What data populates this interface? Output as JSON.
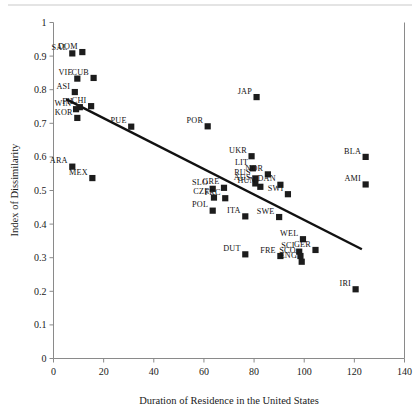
{
  "chart_data": {
    "type": "scatter",
    "title": "",
    "xlabel": "Duration of Residence in the United States",
    "ylabel": "Index of Dissimilarity",
    "xlim": [
      0,
      140
    ],
    "ylim": [
      0,
      1
    ],
    "xticks": [
      0,
      20,
      40,
      60,
      80,
      100,
      120,
      140
    ],
    "yticks": [
      0,
      0.1,
      0.2,
      0.3,
      0.4,
      0.5,
      0.6,
      0.7,
      0.8,
      0.9,
      1
    ],
    "xticklabels": [
      "0",
      "20",
      "40",
      "60",
      "80",
      "100",
      "120",
      "140"
    ],
    "yticklabels": [
      "0",
      "0.1",
      "0.2",
      "0.3",
      "0.4",
      "0.5",
      "0.6",
      "0.7",
      "0.8",
      "0.9",
      "1"
    ],
    "grid": false,
    "legend": null,
    "marker_shape": "square",
    "marker_color": "#1c1c1c",
    "trendline": {
      "type": "linear",
      "x0": 5.0,
      "y0": 0.772,
      "x1": 123.0,
      "y1": 0.325,
      "color": "#111111"
    },
    "points": [
      {
        "label": "SAL",
        "x": 7.5,
        "y": 0.908
      },
      {
        "label": "DOM",
        "x": 11.5,
        "y": 0.912
      },
      {
        "label": "VIE",
        "x": 9.5,
        "y": 0.833
      },
      {
        "label": "CUB",
        "x": 16.0,
        "y": 0.835
      },
      {
        "label": "ASI",
        "x": 8.5,
        "y": 0.793
      },
      {
        "label": "FIL",
        "x": 10.5,
        "y": 0.748
      },
      {
        "label": "CHI",
        "x": 15.0,
        "y": 0.751
      },
      {
        "label": "WIN",
        "x": 9.0,
        "y": 0.742
      },
      {
        "label": "KOR",
        "x": 9.5,
        "y": 0.716
      },
      {
        "label": "PUE",
        "x": 31.0,
        "y": 0.69
      },
      {
        "label": "ARA",
        "x": 7.5,
        "y": 0.571
      },
      {
        "label": "MEX",
        "x": 15.5,
        "y": 0.537
      },
      {
        "label": "JAP",
        "x": 81.0,
        "y": 0.778
      },
      {
        "label": "POR",
        "x": 61.5,
        "y": 0.691
      },
      {
        "label": "UKR",
        "x": 79.0,
        "y": 0.602
      },
      {
        "label": "LIT",
        "x": 79.5,
        "y": 0.566
      },
      {
        "label": "NOR",
        "x": 85.5,
        "y": 0.548
      },
      {
        "label": "RUS",
        "x": 80.5,
        "y": 0.536
      },
      {
        "label": "AUS",
        "x": 80.5,
        "y": 0.521
      },
      {
        "label": "HUN",
        "x": 82.5,
        "y": 0.511
      },
      {
        "label": "DAN",
        "x": 90.5,
        "y": 0.517
      },
      {
        "label": "SWI",
        "x": 93.5,
        "y": 0.489
      },
      {
        "label": "SLO",
        "x": 63.5,
        "y": 0.505
      },
      {
        "label": "GRE",
        "x": 68.0,
        "y": 0.508
      },
      {
        "label": "CZE",
        "x": 64.0,
        "y": 0.479
      },
      {
        "label": "FRC",
        "x": 68.5,
        "y": 0.477
      },
      {
        "label": "POL",
        "x": 63.5,
        "y": 0.44
      },
      {
        "label": "ITA",
        "x": 76.5,
        "y": 0.423
      },
      {
        "label": "SWE",
        "x": 90.0,
        "y": 0.421
      },
      {
        "label": "WEL",
        "x": 99.5,
        "y": 0.355
      },
      {
        "label": "SCI",
        "x": 98.0,
        "y": 0.318
      },
      {
        "label": "GER",
        "x": 104.5,
        "y": 0.323
      },
      {
        "label": "SCO",
        "x": 98.5,
        "y": 0.305
      },
      {
        "label": "ENG",
        "x": 99.0,
        "y": 0.288
      },
      {
        "label": "DUT",
        "x": 76.5,
        "y": 0.31
      },
      {
        "label": "FRE",
        "x": 90.5,
        "y": 0.305
      },
      {
        "label": "BLA",
        "x": 124.5,
        "y": 0.6
      },
      {
        "label": "AMI",
        "x": 124.5,
        "y": 0.518
      },
      {
        "label": "IRI",
        "x": 120.5,
        "y": 0.206
      }
    ]
  }
}
